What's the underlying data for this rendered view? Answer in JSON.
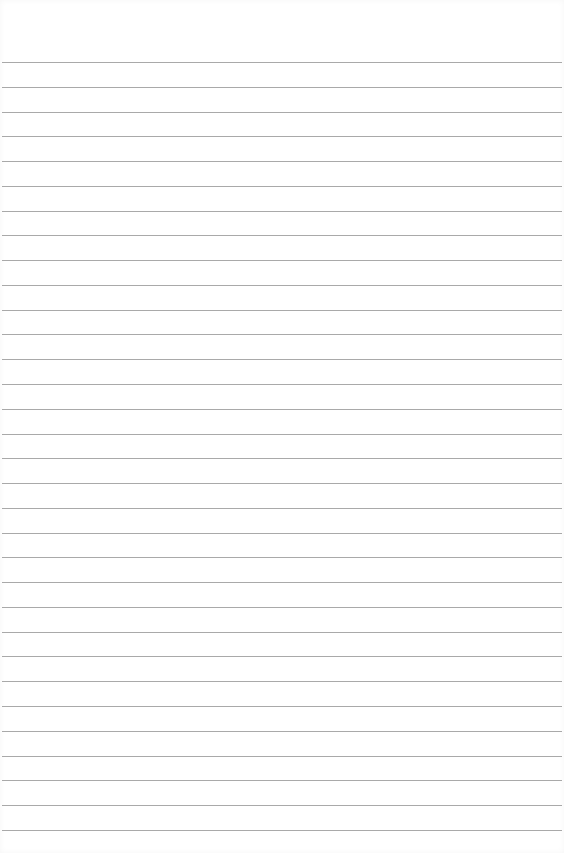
{
  "paper": {
    "background": "#ffffff",
    "line_color": "#a9a9a9",
    "line_count": 32,
    "first_line_y": 62,
    "line_spacing": 24.77,
    "text": ""
  }
}
